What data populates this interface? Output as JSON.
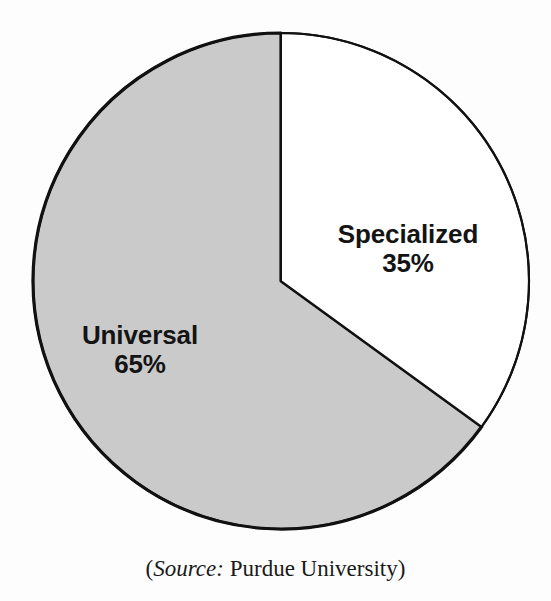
{
  "figure": {
    "background_color": "#fdfdfd",
    "outline_color": "#111111",
    "source_caption": {
      "open_paren": "(",
      "source_word": "Source:",
      "organization": " Purdue University",
      "close_paren": ")",
      "full_text": "(Source: Purdue University)"
    }
  },
  "chart_data": {
    "type": "pie",
    "title": "",
    "subtitle": "",
    "xlabel": "",
    "ylabel": "",
    "legend_position": "none",
    "grid": false,
    "labels_inside_slices": true,
    "start_angle_deg": 0,
    "direction": "clockwise",
    "categories": [
      "Specialized",
      "Universal"
    ],
    "values": [
      35,
      65
    ],
    "value_suffix": "%",
    "slices": [
      {
        "name": "Specialized",
        "value": 35,
        "value_label": "35%",
        "fill": "#ffffff",
        "stroke": "#111111",
        "start_angle_deg": 0,
        "end_angle_deg": 126
      },
      {
        "name": "Universal",
        "value": 65,
        "value_label": "65%",
        "fill": "#cacaca",
        "stroke": "#111111",
        "start_angle_deg": 126,
        "end_angle_deg": 360
      }
    ],
    "annotations": [
      "(Source: Purdue University)"
    ]
  }
}
